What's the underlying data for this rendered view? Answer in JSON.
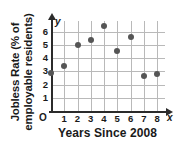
{
  "chart_data": {
    "type": "scatter",
    "title": "",
    "xlabel": "Years Since 2008",
    "ylabel": "Jobless Rate (% of employable residents)",
    "ylabel_line1": "Jobless Rate (% of",
    "ylabel_line2": "employable residents)",
    "x_axis_symbol": "x",
    "y_axis_symbol": "y",
    "origin_label": "O",
    "xlim": [
      0,
      8.6
    ],
    "ylim": [
      0,
      6.8
    ],
    "xticks": [
      1,
      2,
      3,
      4,
      5,
      6,
      7,
      8
    ],
    "yticks": [
      1,
      2,
      3,
      4,
      5,
      6
    ],
    "xtick_labels": [
      "1",
      "2",
      "3",
      "4",
      "5",
      "6",
      "7",
      "8"
    ],
    "ytick_labels": [
      "1",
      "2",
      "3",
      "4",
      "5",
      "6"
    ],
    "grid": true,
    "legend": "none",
    "x": [
      0,
      1,
      2,
      3,
      4,
      5,
      6,
      7,
      8
    ],
    "values": [
      2.9,
      3.4,
      4.95,
      5.35,
      6.4,
      4.55,
      5.6,
      2.65,
      2.8
    ],
    "points": [
      {
        "x": 0,
        "y": 2.9
      },
      {
        "x": 1,
        "y": 3.4
      },
      {
        "x": 2,
        "y": 4.95
      },
      {
        "x": 3,
        "y": 5.35
      },
      {
        "x": 4,
        "y": 6.4
      },
      {
        "x": 5,
        "y": 4.55
      },
      {
        "x": 6,
        "y": 5.6
      },
      {
        "x": 7,
        "y": 2.65
      },
      {
        "x": 8,
        "y": 2.8
      }
    ],
    "marker_color": "#555555",
    "grid_color": "#b9b9b9",
    "axis_color": "#2b2b2b"
  }
}
